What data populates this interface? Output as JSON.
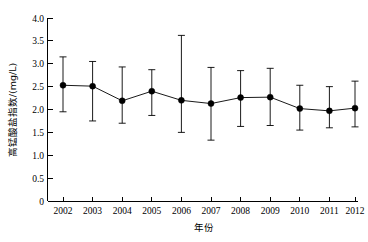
{
  "chart_data": {
    "type": "line",
    "title": "",
    "xlabel": "年份",
    "ylabel": "高锰酸盐指数/(mg/L)",
    "x": [
      2002,
      2003,
      2004,
      2005,
      2006,
      2007,
      2008,
      2009,
      2010,
      2011,
      2012
    ],
    "categories": [
      "2002",
      "2003",
      "2004",
      "2005",
      "2006",
      "2007",
      "2008",
      "2009",
      "2010",
      "2011",
      "2012"
    ],
    "values": [
      2.53,
      2.51,
      2.19,
      2.4,
      2.2,
      2.13,
      2.26,
      2.27,
      2.02,
      1.97,
      2.03
    ],
    "error_upper": [
      3.15,
      3.05,
      2.93,
      2.87,
      3.62,
      2.92,
      2.85,
      2.9,
      2.53,
      2.5,
      2.62
    ],
    "error_lower": [
      1.95,
      1.75,
      1.7,
      1.87,
      1.5,
      1.33,
      1.63,
      1.65,
      1.55,
      1.6,
      1.62
    ],
    "series": [
      {
        "name": "高锰酸盐指数",
        "values": [
          2.53,
          2.51,
          2.19,
          2.4,
          2.2,
          2.13,
          2.26,
          2.27,
          2.02,
          1.97,
          2.03
        ],
        "error_upper": [
          3.15,
          3.05,
          2.93,
          2.87,
          3.62,
          2.92,
          2.85,
          2.9,
          2.53,
          2.5,
          2.62
        ],
        "error_lower": [
          1.95,
          1.75,
          1.7,
          1.87,
          1.5,
          1.33,
          1.63,
          1.65,
          1.55,
          1.6,
          1.62
        ],
        "marker": "filled-circle",
        "color": "#000000"
      }
    ],
    "ylim": [
      0,
      4.0
    ],
    "yticks": [
      0,
      0.5,
      1.0,
      1.5,
      2.0,
      2.5,
      3.0,
      3.5,
      4.0
    ],
    "ytick_labels": [
      "0",
      "0.5",
      "1.0",
      "1.5",
      "2.0",
      "2.5",
      "3.0",
      "3.5",
      "4.0"
    ],
    "xtick_labels": [
      "2002",
      "2003",
      "2004",
      "2005",
      "2006",
      "2007",
      "2008",
      "2009",
      "2010",
      "2011",
      "2012"
    ],
    "grid": false,
    "legend": null,
    "legend_position": "none",
    "annotations": []
  },
  "figure": {
    "background_color": "#ffffff",
    "foreground_color": "#000000",
    "width": 368,
    "height": 242
  }
}
